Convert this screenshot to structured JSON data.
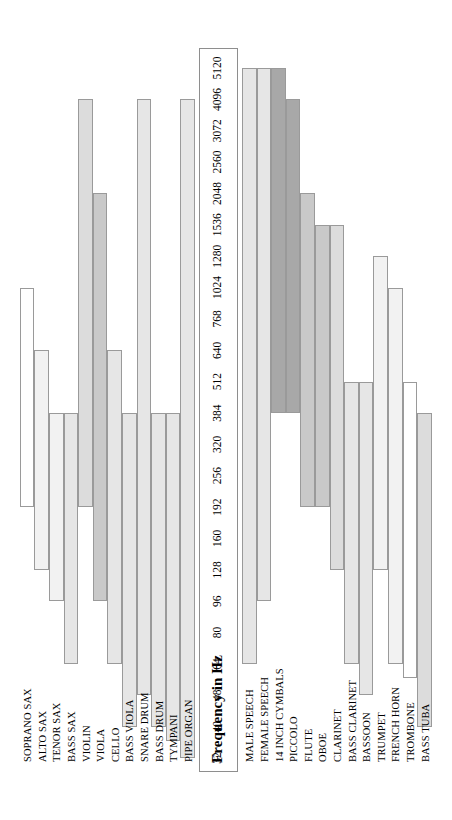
{
  "figure": {
    "axis_title": "Frequency in Hz",
    "axis_unit": "Hz",
    "orientation": "rotated-90",
    "background_color": "#ffffff",
    "border_color": "#8e8e8e"
  },
  "axis": {
    "ticks": [
      32,
      40,
      48,
      64,
      80,
      96,
      128,
      160,
      192,
      256,
      320,
      384,
      512,
      640,
      768,
      1024,
      1280,
      1536,
      2048,
      2560,
      3072,
      4096,
      5120
    ],
    "tick_labels": [
      "32",
      "40",
      "48",
      "64",
      "80",
      "96",
      "128",
      "160",
      "192",
      "256",
      "320",
      "384",
      "512",
      "640",
      "768",
      "1024",
      "1280",
      "1536",
      "2048",
      "2560",
      "3072",
      "4096",
      "5120"
    ],
    "min": 32,
    "max": 5120,
    "scale": "log2"
  },
  "palette": {
    "white": "#ffffff",
    "very_light": "#f2f2f2",
    "light": "#e6e6e6",
    "medium_light": "#dcdcdc",
    "medium": "#c9c9c9",
    "dark": "#a8a8a8",
    "darkest": "#919191",
    "outline": "#9a9a9a"
  },
  "chart_data": {
    "type": "bar",
    "subtype": "range-bar",
    "title": "",
    "xlabel": "Frequency in Hz",
    "ylabel": "",
    "xlim": [
      32,
      5120
    ],
    "xscale": "log2",
    "grid": false,
    "legend": "none",
    "value_unit": "Hz",
    "groups": [
      {
        "name": "group-a",
        "categories": [
          "SOPRANO SAX",
          "ALTO SAX",
          "TENOR SAX",
          "BASS SAX",
          "VIOLIN",
          "VIOLA",
          "CELLO",
          "BASS VIOLA",
          "SNARE DRUM",
          "BASS DRUM",
          "TYMPANI",
          "PIPE ORGAN"
        ],
        "ranges": [
          {
            "label": "SOPRANO SAX",
            "low": 192,
            "high": 1024,
            "color": "#ffffff"
          },
          {
            "label": "ALTO SAX",
            "low": 128,
            "high": 640,
            "color": "#f2f2f2"
          },
          {
            "label": "TENOR SAX",
            "low": 96,
            "high": 384,
            "color": "#f2f2f2"
          },
          {
            "label": "BASS SAX",
            "low": 64,
            "high": 384,
            "color": "#e6e6e6"
          },
          {
            "label": "VIOLIN",
            "low": 192,
            "high": 4096,
            "color": "#dcdcdc"
          },
          {
            "label": "VIOLA",
            "low": 96,
            "high": 2048,
            "color": "#c9c9c9"
          },
          {
            "label": "CELLO",
            "low": 64,
            "high": 640,
            "color": "#e6e6e6"
          },
          {
            "label": "BASS VIOLA",
            "low": 40,
            "high": 384,
            "color": "#e6e6e6"
          },
          {
            "label": "SNARE DRUM",
            "low": 48,
            "high": 4096,
            "color": "#e6e6e6"
          },
          {
            "label": "BASS DRUM",
            "low": 40,
            "high": 384,
            "color": "#e6e6e6"
          },
          {
            "label": "TYMPANI",
            "low": 36,
            "high": 384,
            "color": "#e6e6e6"
          },
          {
            "label": "PIPE ORGAN",
            "low": 32,
            "high": 4096,
            "color": "#e6e6e6"
          }
        ]
      },
      {
        "name": "group-b",
        "categories": [
          "MALE SPEECH",
          "FEMALE SPEECH",
          "14 INCH CYMBALS",
          "PICCOLO",
          "FLUTE",
          "OBOE",
          "CLARINET",
          "BASS CLARINET",
          "BASSOON",
          "TRUMPET",
          "FRENCH HORN",
          "TROMBONE",
          "BASS TUBA"
        ],
        "ranges": [
          {
            "label": "MALE SPEECH",
            "low": 64,
            "high": 5120,
            "color": "#e6e6e6"
          },
          {
            "label": "FEMALE SPEECH",
            "low": 96,
            "high": 5120,
            "color": "#e6e6e6"
          },
          {
            "label": "14 INCH CYMBALS",
            "low": 384,
            "high": 5120,
            "color": "#a8a8a8"
          },
          {
            "label": "PICCOLO",
            "low": 384,
            "high": 4096,
            "color": "#a8a8a8"
          },
          {
            "label": "FLUTE",
            "low": 192,
            "high": 2048,
            "color": "#c9c9c9"
          },
          {
            "label": "OBOE",
            "low": 192,
            "high": 1536,
            "color": "#c9c9c9"
          },
          {
            "label": "CLARINET",
            "low": 128,
            "high": 1536,
            "color": "#dcdcdc"
          },
          {
            "label": "BASS CLARINET",
            "low": 64,
            "high": 512,
            "color": "#e6e6e6"
          },
          {
            "label": "BASSOON",
            "low": 48,
            "high": 512,
            "color": "#e6e6e6"
          },
          {
            "label": "TRUMPET",
            "low": 128,
            "high": 1280,
            "color": "#f2f2f2"
          },
          {
            "label": "FRENCH HORN",
            "low": 64,
            "high": 1024,
            "color": "#f2f2f2"
          },
          {
            "label": "TROMBONE",
            "low": 56,
            "high": 512,
            "color": "#ffffff"
          },
          {
            "label": "BASS TUBA",
            "low": 40,
            "high": 384,
            "color": "#dcdcdc"
          }
        ]
      }
    ]
  }
}
